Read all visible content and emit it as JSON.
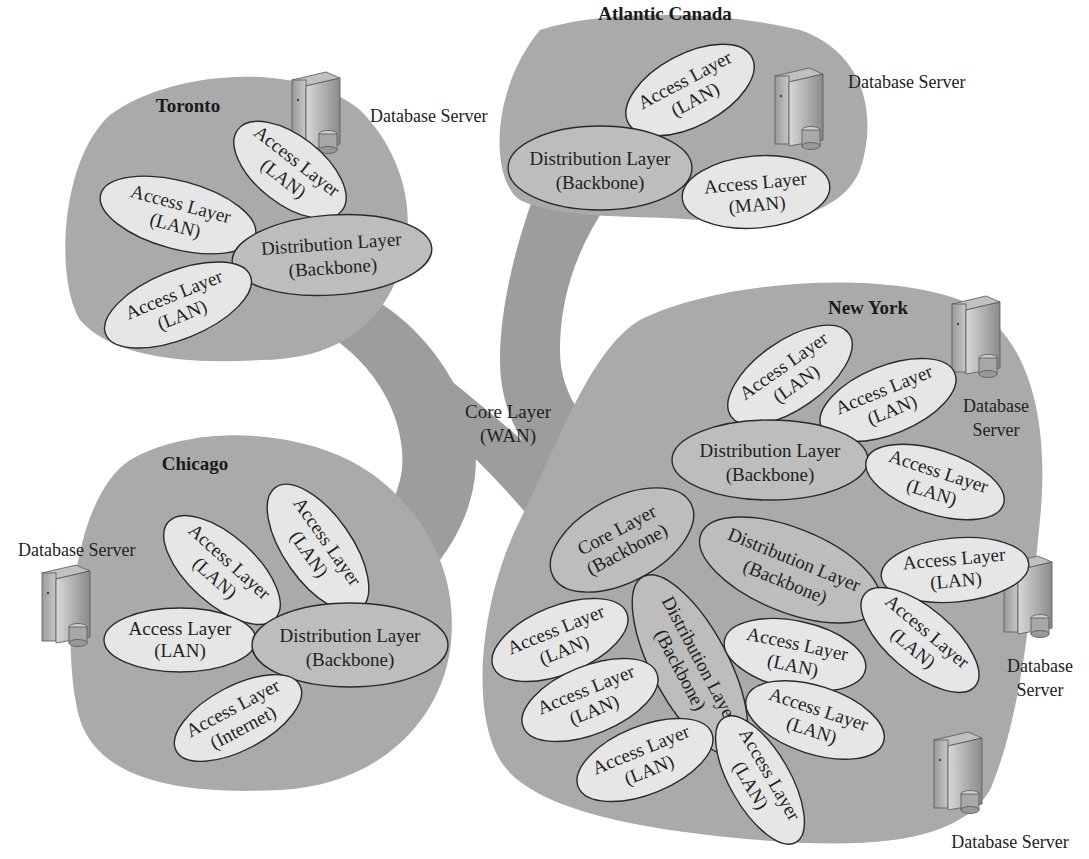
{
  "diagram": {
    "core": {
      "line1": "Core Layer",
      "line2": "(WAN)"
    },
    "regions": {
      "toronto": {
        "title": "Toronto",
        "server_label": "Database Server",
        "nodes": [
          {
            "line1": "Access Layer",
            "line2": "(LAN)"
          },
          {
            "line1": "Access Layer",
            "line2": "(LAN)"
          },
          {
            "line1": "Access Layer",
            "line2": "(LAN)"
          },
          {
            "line1": "Distribution Layer",
            "line2": "(Backbone)"
          }
        ]
      },
      "atlantic": {
        "title": "Atlantic Canada",
        "server_label": "Database Server",
        "nodes": [
          {
            "line1": "Access Layer",
            "line2": "(LAN)"
          },
          {
            "line1": "Distribution Layer",
            "line2": "(Backbone)"
          },
          {
            "line1": "Access Layer",
            "line2": "(MAN)"
          }
        ]
      },
      "chicago": {
        "title": "Chicago",
        "server_label": "Database Server",
        "nodes": [
          {
            "line1": "Access Layer",
            "line2": "(LAN)"
          },
          {
            "line1": "Access Layer",
            "line2": "(LAN)"
          },
          {
            "line1": "Access Layer",
            "line2": "(LAN)"
          },
          {
            "line1": "Distribution Layer",
            "line2": "(Backbone)"
          },
          {
            "line1": "Access Layer",
            "line2": "(Internet)"
          }
        ]
      },
      "newyork": {
        "title": "New York",
        "server_labels": [
          {
            "line1": "Database",
            "line2": "Server"
          },
          {
            "line1": "Database",
            "line2": "Server"
          },
          {
            "line1": "Database Server"
          }
        ],
        "nodes": [
          {
            "line1": "Access Layer",
            "line2": "(LAN)"
          },
          {
            "line1": "Access Layer",
            "line2": "(LAN)"
          },
          {
            "line1": "Distribution Layer",
            "line2": "(Backbone)"
          },
          {
            "line1": "Access Layer",
            "line2": "(LAN)"
          },
          {
            "line1": "Core Layer",
            "line2": "(Backbone)"
          },
          {
            "line1": "Distribution Layer",
            "line2": "(Backbone)"
          },
          {
            "line1": "Access Layer",
            "line2": "(LAN)"
          },
          {
            "line1": "Distribution Layer",
            "line2": "(Backbone)"
          },
          {
            "line1": "Access Layer",
            "line2": "(LAN)"
          },
          {
            "line1": "Access Layer",
            "line2": "(LAN)"
          },
          {
            "line1": "Access Layer",
            "line2": "(LAN)"
          },
          {
            "line1": "Access Layer",
            "line2": "(LAN)"
          },
          {
            "line1": "Access Layer",
            "line2": "(LAN)"
          },
          {
            "line1": "Access Layer",
            "line2": "(LAN)"
          },
          {
            "line1": "Access Layer",
            "line2": "(LAN)"
          }
        ]
      }
    },
    "colors": {
      "region_fill": "#aaaaaa",
      "wan_fill": "#9d9d9d",
      "access_fill": "#e6e6e6",
      "distribution_fill": "#bdbdbd",
      "outline": "#2a2a2a"
    }
  }
}
